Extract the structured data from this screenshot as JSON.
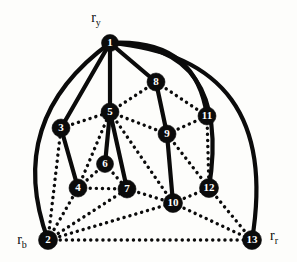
{
  "figure": {
    "background_color": "#fdfdfb",
    "ink_color": "#0b0b0b",
    "node_label_color": "#ffffff"
  },
  "chart_data": {
    "type": "diagram",
    "subtype": "node-link-graph",
    "title": "",
    "node_count": 13,
    "nodes": [
      {
        "id": "1",
        "label": "1",
        "x": 110,
        "y": 43,
        "r": 8.5
      },
      {
        "id": "2",
        "label": "2",
        "x": 48,
        "y": 240,
        "r": 9.5
      },
      {
        "id": "3",
        "label": "3",
        "x": 61,
        "y": 128,
        "r": 9.0
      },
      {
        "id": "4",
        "label": "4",
        "x": 78,
        "y": 188,
        "r": 9.0
      },
      {
        "id": "5",
        "label": "5",
        "x": 110,
        "y": 112,
        "r": 9.0
      },
      {
        "id": "6",
        "label": "6",
        "x": 105,
        "y": 164,
        "r": 8.5
      },
      {
        "id": "7",
        "label": "7",
        "x": 127,
        "y": 189,
        "r": 9.0
      },
      {
        "id": "8",
        "label": "8",
        "x": 156,
        "y": 82,
        "r": 9.0
      },
      {
        "id": "9",
        "label": "9",
        "x": 167,
        "y": 134,
        "r": 9.0
      },
      {
        "id": "10",
        "label": "10",
        "x": 173,
        "y": 203,
        "r": 9.5
      },
      {
        "id": "11",
        "label": "11",
        "x": 207,
        "y": 116,
        "r": 9.0
      },
      {
        "id": "12",
        "label": "12",
        "x": 209,
        "y": 188,
        "r": 9.5
      },
      {
        "id": "13",
        "label": "13",
        "x": 252,
        "y": 240,
        "r": 9.5
      }
    ],
    "terminal_labels": [
      {
        "id": "r_y",
        "base": "r",
        "sub": "y",
        "x": 96,
        "y": 22,
        "attached_node": "1"
      },
      {
        "id": "r_b",
        "base": "r",
        "sub": "b",
        "x": 22,
        "y": 244,
        "attached_node": "2"
      },
      {
        "id": "r_r",
        "base": "r",
        "sub": "r",
        "x": 274,
        "y": 240,
        "attached_node": "13"
      }
    ],
    "edge_styles": {
      "solid": {
        "name": "solid",
        "width": 4.2,
        "dash": "none"
      },
      "dotted": {
        "name": "dotted",
        "width": 3.4,
        "dash": "0.1 6"
      }
    },
    "edges": [
      {
        "from": "1",
        "to": "2",
        "style": "solid",
        "curve": "arc-left",
        "cx": 4,
        "cy": 120
      },
      {
        "from": "1",
        "to": "3",
        "style": "solid",
        "curve": "straight"
      },
      {
        "from": "1",
        "to": "5",
        "style": "solid",
        "curve": "straight"
      },
      {
        "from": "1",
        "to": "8",
        "style": "solid",
        "curve": "straight"
      },
      {
        "from": "1",
        "to": "11",
        "style": "solid",
        "curve": "arc-right",
        "cx": 196,
        "cy": 38
      },
      {
        "from": "1",
        "to": "12",
        "style": "solid",
        "curve": "arc-right",
        "cx": 232,
        "cy": 44
      },
      {
        "from": "1",
        "to": "13",
        "style": "solid",
        "curve": "arc-right",
        "cx": 282,
        "cy": 58
      },
      {
        "from": "3",
        "to": "4",
        "style": "solid",
        "curve": "straight"
      },
      {
        "from": "5",
        "to": "6",
        "style": "solid",
        "curve": "straight"
      },
      {
        "from": "5",
        "to": "7",
        "style": "solid",
        "curve": "straight"
      },
      {
        "from": "8",
        "to": "9",
        "style": "solid",
        "curve": "straight"
      },
      {
        "from": "9",
        "to": "10",
        "style": "solid",
        "curve": "straight"
      },
      {
        "from": "2",
        "to": "3",
        "style": "dotted",
        "curve": "straight"
      },
      {
        "from": "2",
        "to": "4",
        "style": "dotted",
        "curve": "straight"
      },
      {
        "from": "2",
        "to": "7",
        "style": "dotted",
        "curve": "straight"
      },
      {
        "from": "2",
        "to": "10",
        "style": "dotted",
        "curve": "straight"
      },
      {
        "from": "2",
        "to": "13",
        "style": "dotted",
        "curve": "straight"
      },
      {
        "from": "3",
        "to": "5",
        "style": "dotted",
        "curve": "straight"
      },
      {
        "from": "4",
        "to": "5",
        "style": "dotted",
        "curve": "straight"
      },
      {
        "from": "4",
        "to": "6",
        "style": "dotted",
        "curve": "straight"
      },
      {
        "from": "4",
        "to": "7",
        "style": "dotted",
        "curve": "straight"
      },
      {
        "from": "6",
        "to": "7",
        "style": "dotted",
        "curve": "straight"
      },
      {
        "from": "5",
        "to": "8",
        "style": "dotted",
        "curve": "straight"
      },
      {
        "from": "5",
        "to": "9",
        "style": "dotted",
        "curve": "straight"
      },
      {
        "from": "5",
        "to": "10",
        "style": "dotted",
        "curve": "straight"
      },
      {
        "from": "7",
        "to": "10",
        "style": "dotted",
        "curve": "straight"
      },
      {
        "from": "8",
        "to": "11",
        "style": "dotted",
        "curve": "straight"
      },
      {
        "from": "9",
        "to": "11",
        "style": "dotted",
        "curve": "straight"
      },
      {
        "from": "9",
        "to": "12",
        "style": "dotted",
        "curve": "straight"
      },
      {
        "from": "10",
        "to": "12",
        "style": "dotted",
        "curve": "straight"
      },
      {
        "from": "10",
        "to": "13",
        "style": "dotted",
        "curve": "straight"
      },
      {
        "from": "11",
        "to": "12",
        "style": "dotted",
        "curve": "straight"
      },
      {
        "from": "12",
        "to": "13",
        "style": "dotted",
        "curve": "straight"
      }
    ]
  }
}
